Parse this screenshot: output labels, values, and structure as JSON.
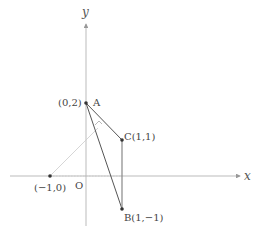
{
  "diagram": {
    "type": "coordinate-geometry",
    "axes": {
      "x_label": "x",
      "y_label": "y",
      "origin_label": "O"
    },
    "points": [
      {
        "id": "A",
        "label": "A",
        "coord_label": "(0,2)",
        "x": 0,
        "y": 2
      },
      {
        "id": "C",
        "label": "C(1,1)",
        "x": 1,
        "y": 1
      },
      {
        "id": "B",
        "label": "B(1,−1)",
        "x": 1,
        "y": -1
      },
      {
        "id": "P",
        "label": "(−1,0)",
        "x": -1,
        "y": 0
      }
    ],
    "segments": [
      {
        "from": "A",
        "to": "C",
        "style": "solid"
      },
      {
        "from": "A",
        "to": "B",
        "style": "solid"
      },
      {
        "from": "C",
        "to": "B",
        "style": "solid"
      },
      {
        "from": "P",
        "to": "foot",
        "style": "light"
      }
    ],
    "annotations": [
      "right-angle mark at foot of perpendicular from (−1,0) to line AC"
    ],
    "colors": {
      "axis": "#aaaaaa",
      "segment": "#555555",
      "helper": "#cccccc",
      "point": "#333333"
    }
  }
}
